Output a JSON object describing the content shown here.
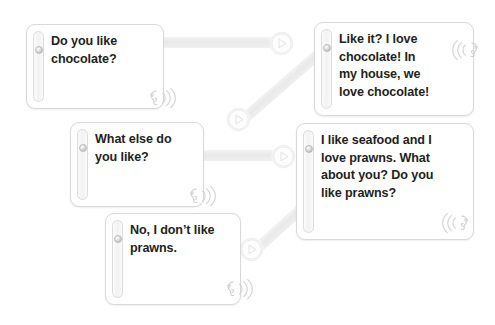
{
  "canvas": {
    "width": 495,
    "height": 325,
    "background": "#ffffff"
  },
  "theme": {
    "card_background": "#ffffff",
    "card_border": "#d9d9d9",
    "text_color": "#231f20",
    "connector_color": "#ececec",
    "handle_color": "#f2f2f2",
    "icon_color": "#cfcfcf"
  },
  "cards": [
    {
      "id": "card-question-chocolate",
      "name": "card-do-you-like-chocolate",
      "text": "Do you like\nchocolate?",
      "x": 26,
      "y": 24,
      "width": 138,
      "height": 85,
      "icon": {
        "name": "speaker-listen-icon",
        "mirrored": false,
        "x": 92,
        "y": 54
      }
    },
    {
      "id": "card-answer-chocolate",
      "name": "card-like-it-i-love-chocolate",
      "text": "Like it? I love\nchocolate! In\nmy house, we\nlove chocolate!",
      "x": 314,
      "y": 22,
      "width": 160,
      "height": 94,
      "icon": {
        "name": "speaker-listen-icon",
        "mirrored": true,
        "x": 112,
        "y": 8
      }
    },
    {
      "id": "card-question-else",
      "name": "card-what-else-do-you-like",
      "text": "What else do\nyou like?",
      "x": 70,
      "y": 122,
      "width": 134,
      "height": 85,
      "icon": {
        "name": "speaker-listen-icon",
        "mirrored": false,
        "x": 88,
        "y": 54
      }
    },
    {
      "id": "card-answer-seafood",
      "name": "card-i-like-seafood-and-i-love-prawns",
      "text": "I like seafood and I\nlove prawns. What\nabout you? Do you\nlike prawns?",
      "x": 296,
      "y": 123,
      "width": 178,
      "height": 117,
      "icon": {
        "name": "speaker-listen-icon",
        "mirrored": true,
        "x": 120,
        "y": 80
      }
    },
    {
      "id": "card-answer-no-prawns",
      "name": "card-no-i-dont-like-prawns",
      "text": "No, I don’t like\nprawns.",
      "x": 105,
      "y": 213,
      "width": 136,
      "height": 92,
      "icon": {
        "name": "speaker-listen-icon",
        "mirrored": false,
        "x": 90,
        "y": 56
      }
    }
  ],
  "connectors": [
    {
      "id": "connector-1",
      "name": "connector-chocolate-question-to-node",
      "x": 163,
      "y": 42,
      "length": 118,
      "thickness": 11,
      "angle": 0
    },
    {
      "id": "connector-2",
      "name": "connector-node-to-chocolate-answer",
      "x": 243,
      "y": 119,
      "length": 98,
      "thickness": 11,
      "angle": -41
    },
    {
      "id": "connector-3",
      "name": "connector-what-else-to-node",
      "x": 203,
      "y": 155,
      "length": 78,
      "thickness": 11,
      "angle": 0
    },
    {
      "id": "connector-4",
      "name": "connector-node-to-seafood-answer",
      "x": 256,
      "y": 249,
      "length": 62,
      "thickness": 11,
      "angle": -42
    }
  ],
  "nodes": [
    {
      "id": "node-1",
      "name": "play-node-chocolate",
      "x": 270,
      "y": 32,
      "size": 21,
      "glyph": "play-triangle-icon"
    },
    {
      "id": "node-2",
      "name": "play-node-chocolate-answer",
      "x": 227,
      "y": 108,
      "size": 21,
      "glyph": "play-triangle-icon"
    },
    {
      "id": "node-3",
      "name": "play-node-what-else",
      "x": 272,
      "y": 145,
      "size": 21,
      "glyph": "play-triangle-icon"
    },
    {
      "id": "node-4",
      "name": "play-node-no-prawns",
      "x": 240,
      "y": 238,
      "size": 21,
      "glyph": "play-triangle-icon"
    }
  ]
}
